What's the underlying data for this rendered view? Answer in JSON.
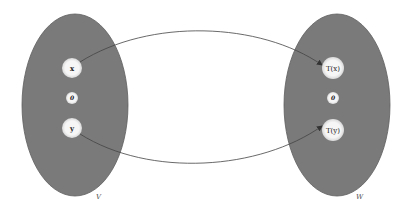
{
  "diagram": {
    "colors": {
      "background": "#ffffff",
      "set_fill": "#7a7a7a",
      "set_stroke": "#5e5e5e",
      "node_fill": "#f4f4f4",
      "arrow": "#444444"
    },
    "sets": [
      {
        "id": "V",
        "label": "V",
        "cx": 75,
        "cy": 105,
        "rx": 53,
        "ry": 91,
        "label_x": 96,
        "label_y": 199
      },
      {
        "id": "W",
        "label": "W",
        "cx": 337,
        "cy": 105,
        "rx": 53,
        "ry": 91,
        "label_x": 356,
        "label_y": 199
      }
    ],
    "nodes": [
      {
        "id": "x",
        "label": "x",
        "set": "V",
        "cx": 72,
        "cy": 68,
        "r": 10
      },
      {
        "id": "zeroV",
        "label": "0",
        "set": "V",
        "cx": 72,
        "cy": 98,
        "r": 6
      },
      {
        "id": "y",
        "label": "y",
        "set": "V",
        "cx": 72,
        "cy": 128,
        "r": 10
      },
      {
        "id": "Tx",
        "label": "T(x)",
        "set": "W",
        "cx": 333,
        "cy": 68,
        "r": 11
      },
      {
        "id": "zeroW",
        "label": "0",
        "set": "W",
        "cx": 333,
        "cy": 98,
        "r": 6
      },
      {
        "id": "Ty",
        "label": "T(y)",
        "set": "W",
        "cx": 333,
        "cy": 130,
        "r": 11
      }
    ],
    "edges": [
      {
        "from": "x",
        "to": "Tx",
        "path": "M 80 62 C 150 18, 260 22, 322 65"
      },
      {
        "from": "y",
        "to": "Ty",
        "path": "M 80 134 C 150 178, 260 170, 322 126"
      }
    ]
  }
}
